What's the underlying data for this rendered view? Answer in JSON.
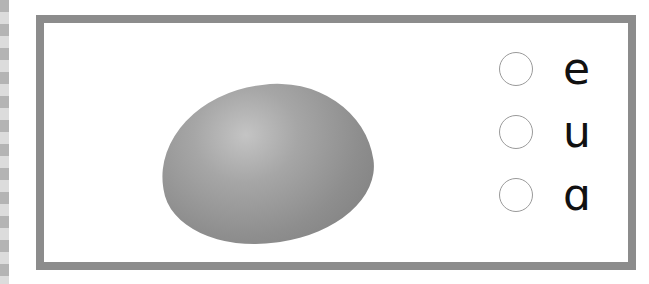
{
  "exercise": {
    "image": {
      "icon": "egg-icon",
      "label": "egg"
    },
    "options": [
      {
        "letter": "e",
        "selected": false
      },
      {
        "letter": "u",
        "selected": false
      },
      {
        "letter": "ɑ",
        "selected": false
      }
    ]
  },
  "colors": {
    "border": "#8c8c8c",
    "egg": "#9a9a9a",
    "text": "#111111"
  }
}
